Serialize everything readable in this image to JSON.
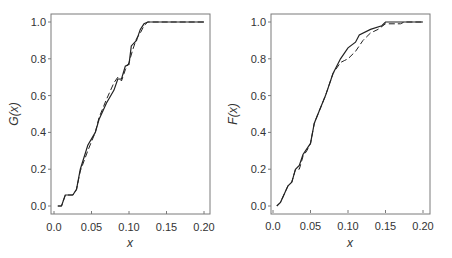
{
  "chart_data": [
    {
      "type": "line",
      "title": "",
      "xlabel": "x",
      "ylabel": "G(x)",
      "xlim": [
        0.0,
        0.2
      ],
      "ylim": [
        0.0,
        1.0
      ],
      "grid": false,
      "legend": null,
      "xticks": [
        "0.0",
        "0.05",
        "0.10",
        "0.15",
        "0.20"
      ],
      "yticks": [
        "0.0",
        "0.2",
        "0.4",
        "0.6",
        "0.8",
        "1.0"
      ],
      "series": [
        {
          "name": "solid",
          "style": "solid",
          "x": [
            0.005,
            0.01,
            0.015,
            0.025,
            0.03,
            0.035,
            0.045,
            0.055,
            0.06,
            0.07,
            0.08,
            0.085,
            0.09,
            0.095,
            0.1,
            0.103,
            0.11,
            0.115,
            0.12,
            0.125,
            0.2
          ],
          "y": [
            0.0,
            0.0,
            0.06,
            0.06,
            0.09,
            0.2,
            0.33,
            0.4,
            0.47,
            0.56,
            0.63,
            0.69,
            0.69,
            0.76,
            0.77,
            0.87,
            0.9,
            0.96,
            0.99,
            1.0,
            1.0
          ]
        },
        {
          "name": "dashed",
          "style": "dashed",
          "x": [
            0.005,
            0.01,
            0.015,
            0.025,
            0.03,
            0.035,
            0.045,
            0.05,
            0.055,
            0.06,
            0.07,
            0.08,
            0.085,
            0.09,
            0.095,
            0.1,
            0.105,
            0.11,
            0.115,
            0.12,
            0.125,
            0.2
          ],
          "y": [
            0.0,
            0.0,
            0.06,
            0.06,
            0.09,
            0.19,
            0.3,
            0.35,
            0.4,
            0.48,
            0.58,
            0.67,
            0.7,
            0.68,
            0.74,
            0.78,
            0.85,
            0.91,
            0.94,
            0.98,
            1.0,
            1.0
          ]
        }
      ]
    },
    {
      "type": "line",
      "title": "",
      "xlabel": "x",
      "ylabel": "F(x)",
      "xlim": [
        0.0,
        0.2
      ],
      "ylim": [
        0.0,
        1.0
      ],
      "grid": false,
      "legend": null,
      "xticks": [
        "0.0",
        "0.05",
        "0.10",
        "0.15",
        "0.20"
      ],
      "yticks": [
        "0.0",
        "0.2",
        "0.4",
        "0.6",
        "0.8",
        "1.0"
      ],
      "series": [
        {
          "name": "solid",
          "style": "solid",
          "x": [
            0.005,
            0.01,
            0.02,
            0.025,
            0.03,
            0.035,
            0.04,
            0.05,
            0.055,
            0.06,
            0.07,
            0.08,
            0.09,
            0.1,
            0.11,
            0.115,
            0.13,
            0.145,
            0.15,
            0.2
          ],
          "y": [
            0.0,
            0.02,
            0.11,
            0.13,
            0.2,
            0.22,
            0.28,
            0.34,
            0.45,
            0.5,
            0.6,
            0.72,
            0.8,
            0.86,
            0.89,
            0.93,
            0.96,
            0.98,
            1.0,
            1.0
          ]
        },
        {
          "name": "dashed",
          "style": "dashed",
          "x": [
            0.005,
            0.01,
            0.02,
            0.025,
            0.03,
            0.035,
            0.04,
            0.045,
            0.05,
            0.055,
            0.06,
            0.07,
            0.08,
            0.09,
            0.095,
            0.1,
            0.11,
            0.12,
            0.13,
            0.14,
            0.15,
            0.17,
            0.175,
            0.2
          ],
          "y": [
            0.0,
            0.02,
            0.11,
            0.13,
            0.2,
            0.2,
            0.27,
            0.3,
            0.34,
            0.45,
            0.5,
            0.6,
            0.72,
            0.78,
            0.79,
            0.8,
            0.84,
            0.9,
            0.94,
            0.96,
            0.99,
            0.99,
            1.0,
            1.0
          ]
        }
      ]
    }
  ],
  "panels": [
    {
      "ylabel": "G(x)",
      "xlabel": "x",
      "xticks": [
        "0.0",
        "0.05",
        "0.10",
        "0.15",
        "0.20"
      ],
      "yticks": [
        "0.0",
        "0.2",
        "0.4",
        "0.6",
        "0.8",
        "1.0"
      ]
    },
    {
      "ylabel": "F(x)",
      "xlabel": "x",
      "xticks": [
        "0.0",
        "0.05",
        "0.10",
        "0.15",
        "0.20"
      ],
      "yticks": [
        "0.0",
        "0.2",
        "0.4",
        "0.6",
        "0.8",
        "1.0"
      ]
    }
  ]
}
